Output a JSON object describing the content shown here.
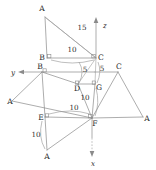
{
  "figure": {
    "stroke_color": "#8a8a8a",
    "text_color": "#2b2b2b",
    "background": "#ffffff"
  },
  "axes": [
    {
      "id": "x",
      "label": "x",
      "direction": "down"
    },
    {
      "id": "y",
      "label": "y",
      "direction": "left"
    },
    {
      "id": "z",
      "label": "z",
      "direction": "up"
    }
  ],
  "vertices": [
    {
      "id": "A_top",
      "label": "A",
      "x": 45,
      "y": 13
    },
    {
      "id": "B_upper",
      "label": "B",
      "x": 47,
      "y": 58
    },
    {
      "id": "C_upper",
      "label": "C",
      "x": 96,
      "y": 58
    },
    {
      "id": "B_mid",
      "label": "B",
      "x": 42,
      "y": 72
    },
    {
      "id": "D_mid",
      "label": "D",
      "x": 78,
      "y": 84
    },
    {
      "id": "G_mid",
      "label": "G",
      "x": 95,
      "y": 84
    },
    {
      "id": "C_right",
      "label": "C",
      "x": 118,
      "y": 72
    },
    {
      "id": "A_left",
      "label": "A",
      "x": 12,
      "y": 101
    },
    {
      "id": "E_low",
      "label": "E",
      "x": 45,
      "y": 117
    },
    {
      "id": "F_low",
      "label": "F",
      "x": 92,
      "y": 118
    },
    {
      "id": "A_right",
      "label": "A",
      "x": 143,
      "y": 117
    },
    {
      "id": "A_bottom",
      "label": "A",
      "x": 47,
      "y": 154
    }
  ],
  "dimensions": [
    {
      "id": "dim-15",
      "value": "15",
      "x": 71,
      "y": 27,
      "measures": "A_top-to-C_upper"
    },
    {
      "id": "dim-10-top",
      "value": "10",
      "x": 67,
      "y": 50,
      "measures": "B_upper-to-C_upper"
    },
    {
      "id": "dim-5-left",
      "value": "5",
      "x": 83,
      "y": 70,
      "measures": "D_mid-to-C_upper"
    },
    {
      "id": "dim-5-right",
      "value": "5",
      "x": 101,
      "y": 70,
      "measures": "C_upper-to-G_mid"
    },
    {
      "id": "dim-10-midv",
      "value": "10",
      "x": 82,
      "y": 98,
      "measures": "G_mid-to-F_low"
    },
    {
      "id": "dim-10-midh",
      "value": "10",
      "x": 70,
      "y": 108,
      "measures": "E_low-to-F_low"
    },
    {
      "id": "dim-10-low",
      "value": "10",
      "x": 36,
      "y": 134,
      "measures": "E_low-to-A_bottom"
    }
  ],
  "axis_labels": [
    {
      "id": "label-z",
      "text": "z",
      "x": 103,
      "y": 25
    },
    {
      "id": "label-y",
      "text": "y",
      "x": 13,
      "y": 76
    },
    {
      "id": "label-x",
      "text": "x",
      "x": 95,
      "y": 163
    }
  ]
}
